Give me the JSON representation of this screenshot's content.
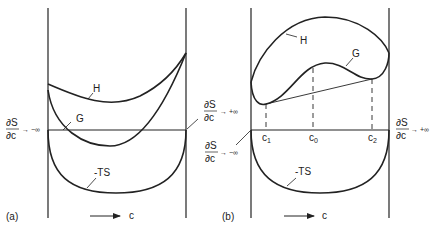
{
  "panel_a": {
    "label": "(a)",
    "curve_labels": {
      "H": "H",
      "G": "G",
      "TS": "-TS"
    },
    "left_limit": {
      "num": "∂S",
      "den": "∂c",
      "arrow": "→ −∞"
    },
    "right_limit": {
      "num": "∂S",
      "den": "∂c",
      "arrow": "→ +∞"
    },
    "axis_label": "c"
  },
  "panel_b": {
    "label": "(b)",
    "curve_labels": {
      "H": "H",
      "G": "G",
      "TS": "-TS"
    },
    "left_limit": {
      "num": "∂S",
      "den": "∂c",
      "arrow": "→ −∞"
    },
    "right_limit": {
      "num": "∂S",
      "den": "∂c",
      "arrow": "→ +∞"
    },
    "composition_marks": {
      "c1": "c",
      "c1_sub": "1",
      "c0": "c",
      "c0_sub": "0",
      "c2": "c",
      "c2_sub": "2"
    },
    "axis_label": "c"
  },
  "colors": {
    "line": "#222222",
    "background": "#ffffff"
  }
}
